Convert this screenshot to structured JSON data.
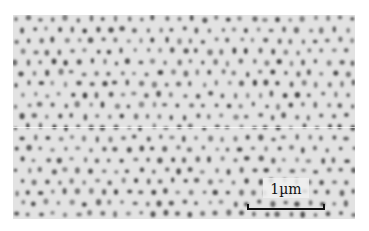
{
  "image": {
    "kind": "electron micrograph",
    "description": "Hexagonally ordered array of dark pores/dots on a light gray background",
    "background_color": "#e2e2e2",
    "dot_color": "#3c3c3c",
    "dot_spacing_px": 12.5
  },
  "scale_bar": {
    "label": "1µm",
    "length_px": 78
  }
}
